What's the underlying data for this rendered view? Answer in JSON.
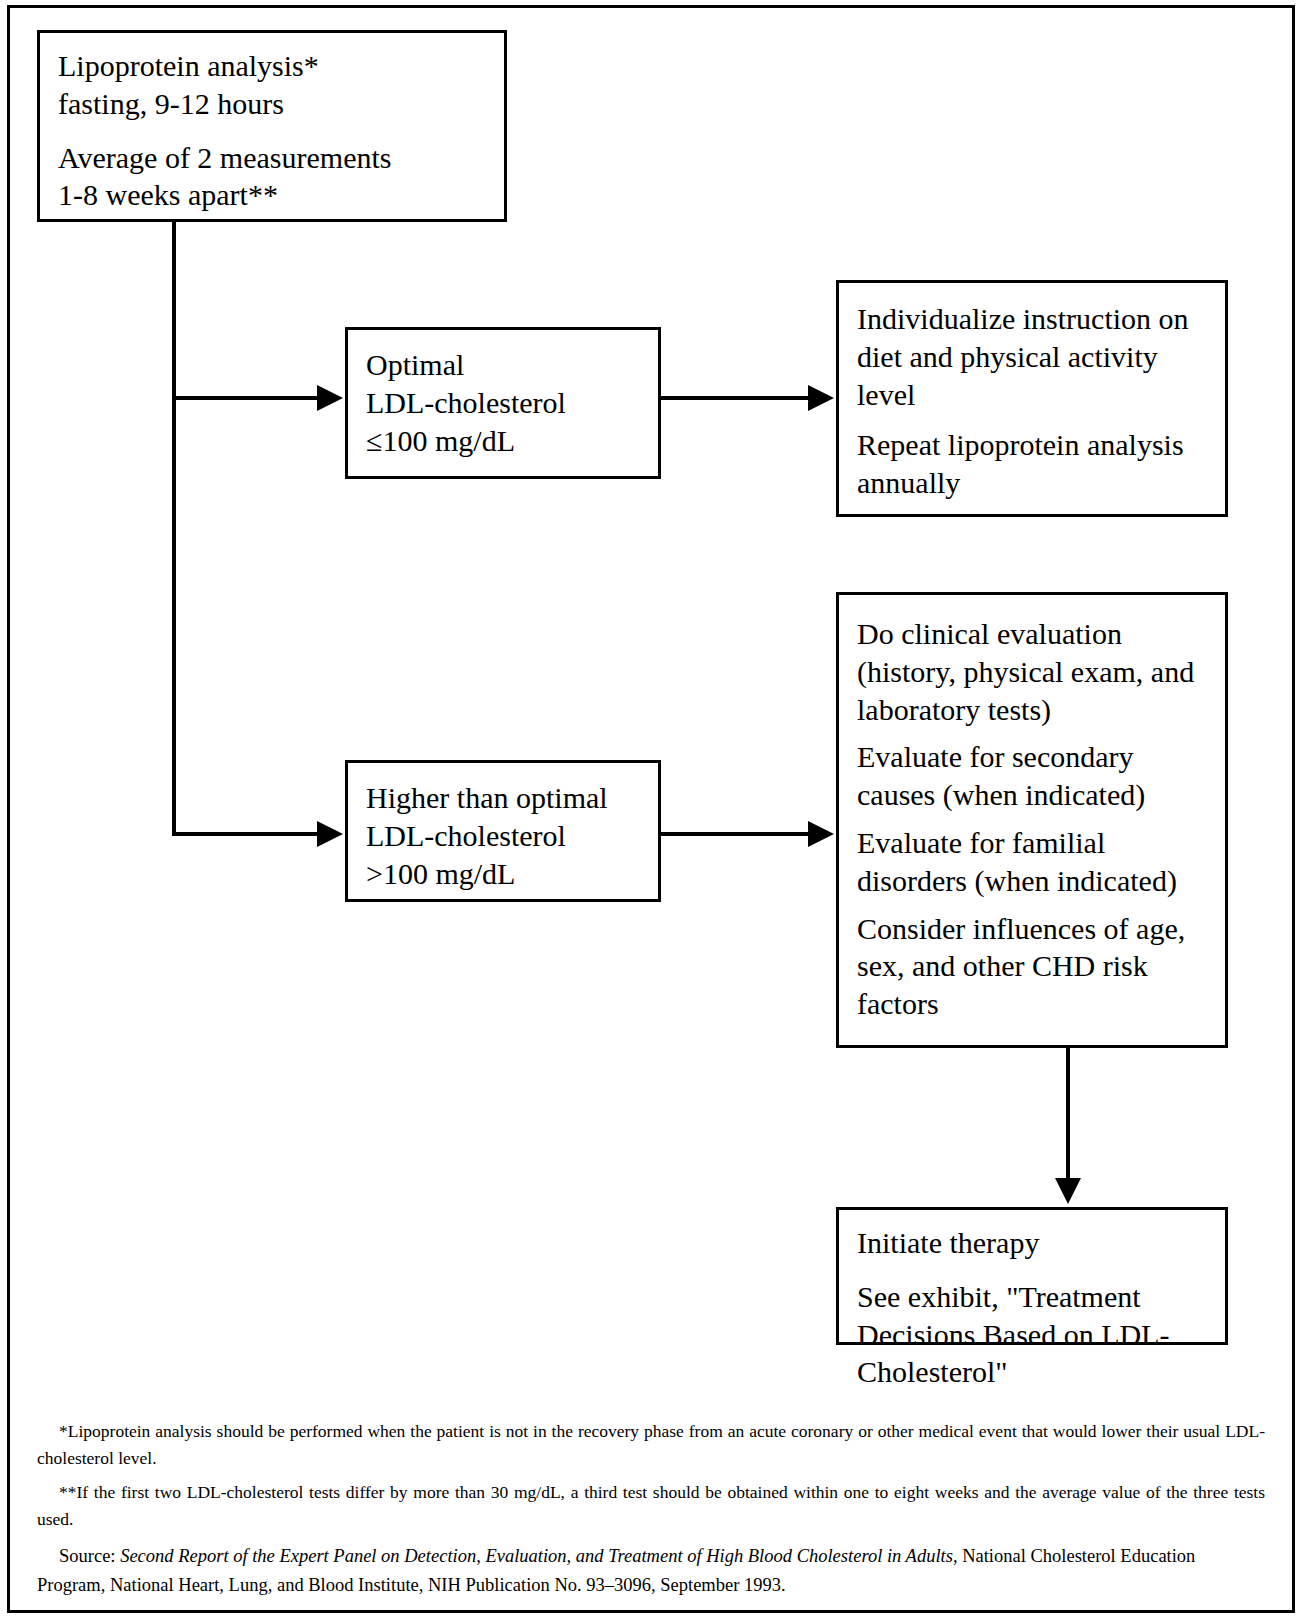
{
  "document": {
    "type": "clinical-flowchart",
    "title": "Primary Prevention in Persons Without Evidence of CHD: Lipoprotein Analysis Flowchart"
  },
  "nodes": {
    "lipoprotein": {
      "name": "lipoprotein-analysis",
      "lines": [
        "Lipoprotein analysis*\nfasting, 9-12 hours",
        "Average of 2 measurements\n1-8 weeks apart**"
      ],
      "line1a": "Lipoprotein analysis*",
      "line1b": "fasting, 9-12 hours",
      "line2a": "Average of 2 measurements",
      "line2b": "1-8 weeks apart**"
    },
    "optimal": {
      "name": "optimal-ldl",
      "line1": "Optimal",
      "line2": "LDL-cholesterol",
      "line3": "≤100 mg/dL"
    },
    "individualize": {
      "name": "individualize-instruction",
      "para1": "Individualize instruction on diet and physical activity level",
      "para2": "Repeat lipoprotein analysis annually"
    },
    "higher": {
      "name": "higher-than-optimal-ldl",
      "line1": "Higher than optimal",
      "line2": "LDL-cholesterol",
      "line3": ">100 mg/dL"
    },
    "clinical": {
      "name": "clinical-evaluation",
      "para1": "Do clinical evaluation (history, physical exam, and laboratory tests)",
      "para2": "Evaluate for secondary causes (when indicated)",
      "para3": "Evaluate for familial disorders (when indicated)",
      "para4": "Consider influences of age, sex, and other CHD risk factors"
    },
    "initiate": {
      "name": "initiate-therapy",
      "para1": "Initiate therapy",
      "para2": "See exhibit, \"Treatment Decisions Based on LDL-Cholesterol\""
    }
  },
  "footnotes": {
    "first": "*Lipoprotein analysis should be performed when the patient is not in the recovery phase from an acute coronary or other medical event that would lower their usual LDL-cholesterol level.",
    "second": "**If the first two LDL-cholesterol tests differ by more than 30 mg/dL, a third test should be obtained within one to eight weeks and the average value of the three tests used."
  },
  "source": {
    "label": "Source: ",
    "title_italic": "Second Report of the Expert Panel on Detection, Evaluation, and Treatment of High Blood Cholesterol in Adults",
    "rest": ", National Cholesterol Education Program, National Heart, Lung, and Blood Institute, NIH Publication No. 93–3096, September 1993."
  },
  "colors": {
    "ink": "#000000",
    "paper": "#ffffff"
  }
}
